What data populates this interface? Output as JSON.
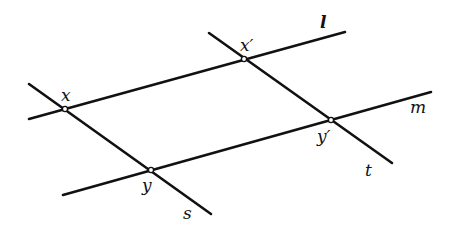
{
  "figure": {
    "colors": {
      "background": "#ffffff",
      "stroke": "#111111"
    }
  },
  "lines": [
    {
      "name": "l",
      "label": "l",
      "x1": 29,
      "y1": 119,
      "x2": 345,
      "y2": 32,
      "label_x": 320,
      "label_y": 28
    },
    {
      "name": "m",
      "label": "m",
      "x1": 63,
      "y1": 195,
      "x2": 431,
      "y2": 92,
      "label_x": 410,
      "label_y": 113
    },
    {
      "name": "s",
      "label": "s",
      "x1": 29,
      "y1": 84,
      "x2": 211,
      "y2": 214,
      "label_x": 183,
      "label_y": 219
    },
    {
      "name": "t",
      "label": "t",
      "x1": 209,
      "y1": 33,
      "x2": 392,
      "y2": 163,
      "label_x": 365,
      "label_y": 176
    }
  ],
  "points": [
    {
      "name": "x",
      "label": "x",
      "cx": 65,
      "cy": 109,
      "label_x": 61,
      "label_y": 101
    },
    {
      "name": "x-prime",
      "label": "x′",
      "cx": 244,
      "cy": 59,
      "label_x": 240,
      "label_y": 51
    },
    {
      "name": "y-prime",
      "label": "y′",
      "cx": 331,
      "cy": 120,
      "label_x": 317,
      "label_y": 142
    },
    {
      "name": "y",
      "label": "y",
      "cx": 151,
      "cy": 170,
      "label_x": 142,
      "label_y": 191
    }
  ]
}
